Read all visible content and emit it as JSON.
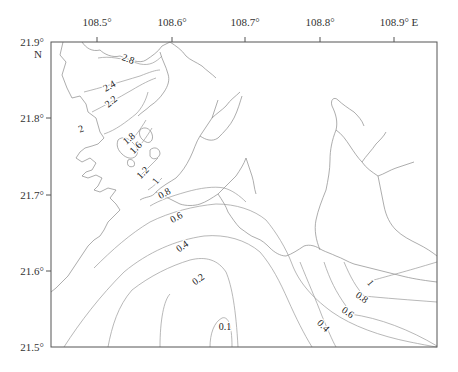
{
  "map": {
    "frame": {
      "left": 51,
      "top": 42,
      "right": 437,
      "bottom": 347
    },
    "longitude_ticks": [
      {
        "label": "108.5°",
        "x": 97
      },
      {
        "label": "108.6°",
        "x": 172
      },
      {
        "label": "108.7°",
        "x": 245
      },
      {
        "label": "108.8°",
        "x": 320
      },
      {
        "label": "108.9° E",
        "x": 394
      }
    ],
    "latitude_ticks": [
      {
        "label": "21.9°",
        "y": 42
      },
      {
        "label": "21.8°",
        "y": 118
      },
      {
        "label": "21.7°",
        "y": 195
      },
      {
        "label": "21.6°",
        "y": 271
      },
      {
        "label": "21.5°",
        "y": 347
      }
    ],
    "north_label": "N",
    "contour_labels": [
      {
        "text": "2.8",
        "x": 127,
        "y": 62,
        "rot": 20
      },
      {
        "text": "2.4",
        "x": 111,
        "y": 89,
        "rot": -30
      },
      {
        "text": "2.2",
        "x": 113,
        "y": 104,
        "rot": -40
      },
      {
        "text": "2",
        "x": 82,
        "y": 132,
        "rot": -20
      },
      {
        "text": "1.8",
        "x": 131,
        "y": 141,
        "rot": -40
      },
      {
        "text": "1.6",
        "x": 138,
        "y": 150,
        "rot": -45
      },
      {
        "text": "1.2",
        "x": 145,
        "y": 175,
        "rot": -45
      },
      {
        "text": "1",
        "x": 158,
        "y": 183,
        "rot": -50
      },
      {
        "text": "0.8",
        "x": 166,
        "y": 196,
        "rot": -30
      },
      {
        "text": "0.6",
        "x": 178,
        "y": 220,
        "rot": -30
      },
      {
        "text": "0.4",
        "x": 184,
        "y": 249,
        "rot": -35
      },
      {
        "text": "0.2",
        "x": 200,
        "y": 282,
        "rot": -35
      },
      {
        "text": "0.1",
        "x": 225,
        "y": 330,
        "rot": 0
      },
      {
        "text": "1",
        "x": 368,
        "y": 285,
        "rot": 50
      },
      {
        "text": "0.8",
        "x": 360,
        "y": 300,
        "rot": 35
      },
      {
        "text": "0.6",
        "x": 346,
        "y": 315,
        "rot": 35
      },
      {
        "text": "0.4",
        "x": 321,
        "y": 328,
        "rot": 45
      }
    ],
    "colors": {
      "frame": "#555555",
      "coastline": "#8a8a8a",
      "contour": "#9a9a9a",
      "text": "#222222"
    }
  },
  "chart_data": {
    "type": "contour",
    "title": "",
    "xlabel": "Longitude (E)",
    "ylabel": "Latitude (N)",
    "xlim": [
      108.44,
      108.96
    ],
    "ylim": [
      21.5,
      21.9
    ],
    "x_ticks": [
      "108.5°",
      "108.6°",
      "108.7°",
      "108.8°",
      "108.9° E"
    ],
    "y_ticks": [
      "21.5°",
      "21.6°",
      "21.7°",
      "21.8°",
      "21.9°"
    ],
    "contour_levels": [
      0.1,
      0.2,
      0.4,
      0.6,
      0.8,
      1,
      1.2,
      1.6,
      1.8,
      2,
      2.2,
      2.4,
      2.8
    ]
  }
}
